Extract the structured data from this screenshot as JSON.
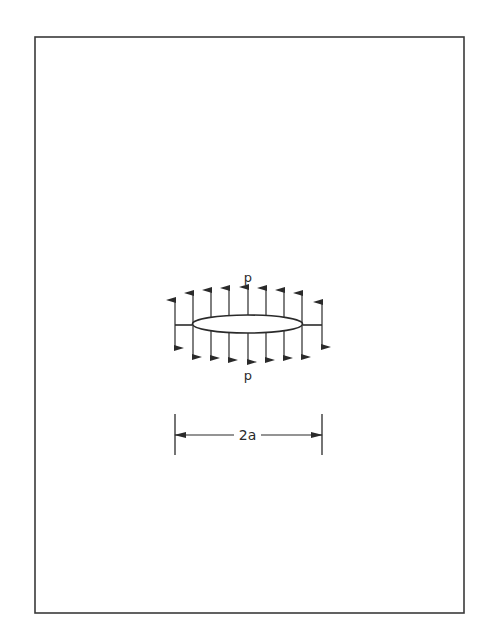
{
  "figure": {
    "labels": {
      "pressure_top": "p",
      "pressure_bottom": "p",
      "crack_length": "2a"
    },
    "frame": {
      "x": 35,
      "y": 37,
      "width": 429,
      "height": 576,
      "stroke": "#3a3a3a"
    },
    "crack": {
      "cx": 247.5,
      "cy": 324,
      "rx": 55,
      "ry": 9
    },
    "stubs": [
      {
        "x1": 175,
        "x2": 192,
        "y": 325
      },
      {
        "x1": 303,
        "x2": 322,
        "y": 325
      }
    ],
    "arrows": [
      {
        "x": 175,
        "top": 300,
        "bottom": 348
      },
      {
        "x": 193,
        "top": 293,
        "bottom": 357
      },
      {
        "x": 211,
        "top": 290,
        "bottom": 358
      },
      {
        "x": 229,
        "top": 288,
        "bottom": 360
      },
      {
        "x": 248,
        "top": 287,
        "bottom": 362
      },
      {
        "x": 266,
        "top": 288,
        "bottom": 360
      },
      {
        "x": 284,
        "top": 290,
        "bottom": 358
      },
      {
        "x": 302,
        "top": 293,
        "bottom": 357
      },
      {
        "x": 322,
        "top": 302,
        "bottom": 347
      }
    ],
    "dimension": {
      "left_x": 175,
      "right_x": 322,
      "y": 435,
      "tick_top": 414,
      "tick_bottom": 455,
      "gap_left": 234,
      "gap_right": 261
    },
    "ink_color": "#2a2a2a"
  }
}
